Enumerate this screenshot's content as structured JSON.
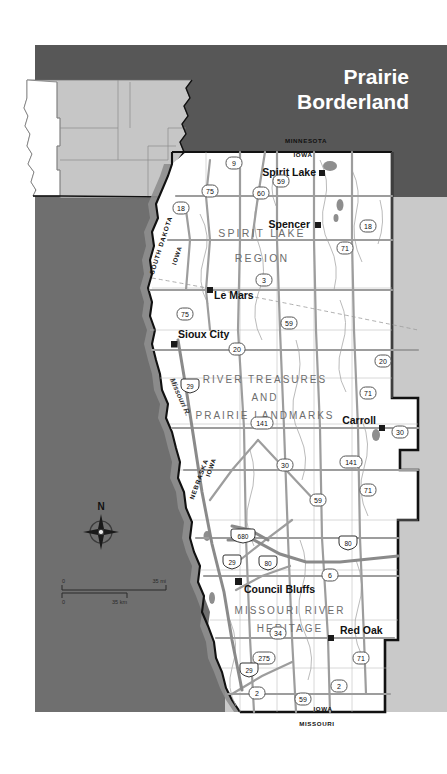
{
  "page": {
    "width": 447,
    "height": 774,
    "background": "#ffffff"
  },
  "title": {
    "line1": "Prairie",
    "line2": "Borderland",
    "color": "#ffffff"
  },
  "colors": {
    "header_band": "#575757",
    "surround_gray": "#6f6f6f",
    "outside_light_gray": "#c9c9c9",
    "inset_state_fill": "#c6c6c6",
    "inset_highlight_fill": "#ffffff",
    "map_fill": "#ffffff",
    "boundary_black": "#000000",
    "road_gray": "#9a9a9a",
    "water_gray": "#8a8a8a",
    "city_marker": "#1a1a1a",
    "shield_outline": "#4a4a4a",
    "interstate_fill": "#3a3a3a"
  },
  "inset_map": {
    "name": "locator-inset",
    "description": "state locator inset, highlighted state in white"
  },
  "region_labels": [
    {
      "id": "spirit-lake-region",
      "line1": "SPIRIT LAKE",
      "line2": "REGION",
      "x": 262,
      "y": 233
    },
    {
      "id": "river-treasures",
      "line1": "RIVER TREASURES",
      "line2": "AND",
      "line3": "PRAIRIE LANDMARKS",
      "x": 265,
      "y": 381
    },
    {
      "id": "missouri-river-heritage",
      "line1": "MISSOURI RIVER",
      "line2": "HERITAGE",
      "x": 290,
      "y": 612
    }
  ],
  "cities": [
    {
      "name": "Spirit Lake",
      "x": 316,
      "y": 176,
      "anchor": "end",
      "mx": 321,
      "my": 173
    },
    {
      "name": "Spencer",
      "x": 310,
      "y": 228,
      "anchor": "end",
      "mx": 317,
      "my": 225
    },
    {
      "name": "Le Mars",
      "x": 226,
      "y": 296,
      "anchor": "start",
      "mx": 210,
      "my": 290
    },
    {
      "name": "Sioux City",
      "x": 183,
      "y": 336,
      "anchor": "start",
      "mx": 174,
      "my": 344
    },
    {
      "name": "Carroll",
      "x": 376,
      "y": 423,
      "anchor": "end",
      "mx": 381,
      "my": 428
    },
    {
      "name": "Council Bluffs",
      "x": 245,
      "y": 590,
      "anchor": "start",
      "mx": 238,
      "my": 581
    },
    {
      "name": "Red Oak",
      "x": 340,
      "y": 633,
      "anchor": "start",
      "mx": 330,
      "my": 638
    }
  ],
  "state_labels": [
    {
      "text": "MINNESOTA",
      "x": 306,
      "y": 143,
      "rotate": 0,
      "size": 6.2
    },
    {
      "text": "IOWA",
      "x": 303,
      "y": 157,
      "rotate": 0,
      "size": 6.2
    },
    {
      "text": "SOUTH DAKOTA",
      "x": 163,
      "y": 246,
      "rotate": -72,
      "size": 6.4
    },
    {
      "text": "IOWA",
      "x": 179,
      "y": 256,
      "rotate": -72,
      "size": 6.2
    },
    {
      "text": "NEBRASKA",
      "x": 201,
      "y": 480,
      "rotate": -70,
      "size": 6.4
    },
    {
      "text": "IOWA",
      "x": 213,
      "y": 470,
      "rotate": -70,
      "size": 6.2
    },
    {
      "text": "IOWA",
      "x": 323,
      "y": 711,
      "rotate": 0,
      "size": 6.2
    },
    {
      "text": "MISSOURI",
      "x": 317,
      "y": 726,
      "rotate": 0,
      "size": 6.2
    }
  ],
  "water_labels": [
    {
      "text": "Missouri R.",
      "x": 178,
      "y": 398,
      "rotate": 66
    }
  ],
  "highway_shields": [
    {
      "num": "9",
      "type": "us",
      "x": 234,
      "y": 164
    },
    {
      "num": "59",
      "type": "us",
      "x": 281,
      "y": 182
    },
    {
      "num": "60",
      "type": "us",
      "x": 261,
      "y": 194
    },
    {
      "num": "75",
      "type": "us",
      "x": 210,
      "y": 192
    },
    {
      "num": "18",
      "type": "us",
      "x": 181,
      "y": 209
    },
    {
      "num": "18",
      "type": "us",
      "x": 368,
      "y": 227
    },
    {
      "num": "71",
      "type": "us",
      "x": 345,
      "y": 249
    },
    {
      "num": "3",
      "type": "us",
      "x": 264,
      "y": 281
    },
    {
      "num": "75",
      "type": "us",
      "x": 185,
      "y": 315
    },
    {
      "num": "59",
      "type": "us",
      "x": 289,
      "y": 324
    },
    {
      "num": "20",
      "type": "us",
      "x": 237,
      "y": 350
    },
    {
      "num": "20",
      "type": "us",
      "x": 383,
      "y": 362
    },
    {
      "num": "29",
      "type": "interstate",
      "x": 190,
      "y": 386
    },
    {
      "num": "71",
      "type": "us",
      "x": 368,
      "y": 394
    },
    {
      "num": "141",
      "type": "us",
      "x": 262,
      "y": 424
    },
    {
      "num": "30",
      "type": "us",
      "x": 400,
      "y": 433
    },
    {
      "num": "30",
      "type": "us",
      "x": 285,
      "y": 466
    },
    {
      "num": "141",
      "type": "us",
      "x": 351,
      "y": 463
    },
    {
      "num": "71",
      "type": "us",
      "x": 368,
      "y": 491
    },
    {
      "num": "59",
      "type": "us",
      "x": 318,
      "y": 501
    },
    {
      "num": "680",
      "type": "interstate",
      "x": 243,
      "y": 537
    },
    {
      "num": "80",
      "type": "interstate",
      "x": 268,
      "y": 563
    },
    {
      "num": "80",
      "type": "interstate",
      "x": 348,
      "y": 543
    },
    {
      "num": "29",
      "type": "interstate",
      "x": 232,
      "y": 562
    },
    {
      "num": "6",
      "type": "us",
      "x": 330,
      "y": 576
    },
    {
      "num": "34",
      "type": "us",
      "x": 278,
      "y": 634
    },
    {
      "num": "275",
      "type": "us",
      "x": 264,
      "y": 659
    },
    {
      "num": "71",
      "type": "us",
      "x": 361,
      "y": 659
    },
    {
      "num": "29",
      "type": "interstate",
      "x": 249,
      "y": 670
    },
    {
      "num": "2",
      "type": "us",
      "x": 257,
      "y": 694
    },
    {
      "num": "59",
      "type": "us",
      "x": 303,
      "y": 700
    },
    {
      "num": "2",
      "type": "us",
      "x": 339,
      "y": 687
    }
  ],
  "compass": {
    "label": "N",
    "x": 101,
    "y": 530
  },
  "scale_bar": {
    "zero_left": "0",
    "zero_left2": "0",
    "miles_label": "35 mi",
    "km_label": "35 km",
    "x": 60,
    "y": 583
  }
}
